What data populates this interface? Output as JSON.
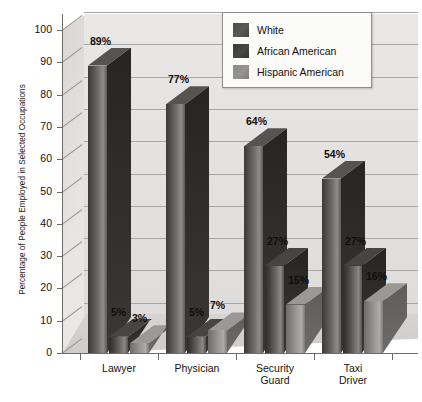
{
  "chart_data": {
    "type": "bar",
    "title": "",
    "subtitle": "",
    "xlabel": "",
    "ylabel": "Percentage of People Employed in Selected Occupations",
    "ylim": [
      0,
      100
    ],
    "ytick_step": 10,
    "ytick_labels": [
      "0",
      "10",
      "20",
      "30",
      "40",
      "50",
      "60",
      "70",
      "80",
      "90",
      "100"
    ],
    "grid": true,
    "grid_orientation": "horizontal",
    "legend_position": "top-right",
    "value_suffix": "%",
    "style": "3d-grouped-bars",
    "categories": [
      "Lawyer",
      "Physician",
      "Security Guard",
      "Taxi Driver"
    ],
    "category_label_lines": [
      [
        "Lawyer"
      ],
      [
        "Physician"
      ],
      [
        "Security",
        "Guard"
      ],
      [
        "Taxi",
        "Driver"
      ]
    ],
    "series": [
      {
        "name": "White",
        "color": "#4d4b4a",
        "values": [
          89,
          77,
          64,
          54
        ],
        "labels": [
          "89%",
          "77%",
          "64%",
          "54%"
        ]
      },
      {
        "name": "African American",
        "color": "#3b3938",
        "values": [
          5,
          5,
          27,
          27
        ],
        "labels": [
          "5%",
          "5%",
          "27%",
          "27%"
        ]
      },
      {
        "name": "Hispanic American",
        "color": "#8a8887",
        "values": [
          3,
          7,
          15,
          16
        ],
        "labels": [
          "3%",
          "7%",
          "15%",
          "16%"
        ]
      }
    ]
  },
  "legend": {
    "items": [
      {
        "label": "White"
      },
      {
        "label": "African American"
      },
      {
        "label": "Hispanic American"
      }
    ]
  }
}
